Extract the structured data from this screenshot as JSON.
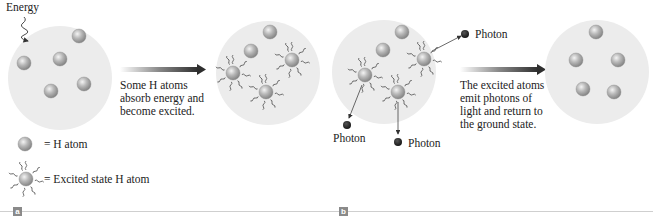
{
  "figure": {
    "panel_a": {
      "label": "a",
      "energy_label": "Energy",
      "arrow_caption": [
        "Some H atoms",
        "absorb energy and",
        "become excited."
      ],
      "before_circle": {
        "ground_atoms": 5,
        "excited_atoms": 0
      },
      "after_circle": {
        "ground_atoms": 2,
        "excited_atoms": 3
      }
    },
    "panel_b": {
      "label": "b",
      "photon_labels": [
        "Photon",
        "Photon",
        "Photon"
      ],
      "arrow_caption": [
        "The excited atoms",
        "emit photons of",
        "light and return to",
        "the ground state."
      ],
      "before_circle": {
        "ground_atoms": 2,
        "excited_atoms": 3
      },
      "after_circle": {
        "ground_atoms": 5,
        "excited_atoms": 0
      }
    },
    "legend": {
      "ground": "= H atom",
      "excited": "= Excited state H atom"
    },
    "colors": {
      "circle_fill": "#ececec",
      "atom_fill": "#a9a9a9",
      "photon": "#2a2a2a",
      "arrow_dark": "#2e2e2e",
      "panel_label_bg": "#8a8a8a",
      "rule": "#cfcfcf"
    }
  }
}
